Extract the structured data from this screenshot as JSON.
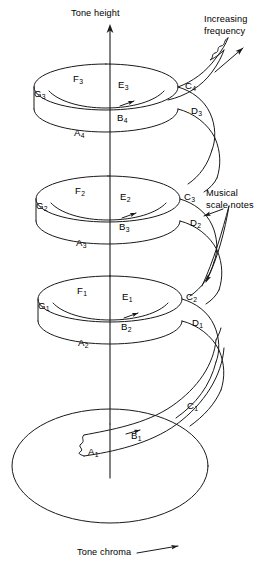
{
  "figure": {
    "stroke_color": "#1a1a1a",
    "text_color": "#000000",
    "background_color": "#ffffff",
    "width": 279,
    "height": 569
  },
  "axis_labels": {
    "tone_height": "Tone height",
    "tone_chroma": "Tone chroma",
    "increasing_frequency": "Increasing\nfrequency",
    "musical_scale_notes": "Musical\nscale notes"
  },
  "notes": [
    {
      "name": "G",
      "octave": "3",
      "x": 34,
      "y": 89
    },
    {
      "name": "F",
      "octave": "3",
      "x": 73,
      "y": 74
    },
    {
      "name": "E",
      "octave": "3",
      "x": 118,
      "y": 80
    },
    {
      "name": "C",
      "octave": "4",
      "x": 185,
      "y": 81
    },
    {
      "name": "D",
      "octave": "3",
      "x": 191,
      "y": 106
    },
    {
      "name": "B",
      "octave": "4",
      "x": 117,
      "y": 113
    },
    {
      "name": "A",
      "octave": "4",
      "x": 74,
      "y": 128
    },
    {
      "name": "G",
      "octave": "2",
      "x": 36,
      "y": 201
    },
    {
      "name": "F",
      "octave": "2",
      "x": 75,
      "y": 186
    },
    {
      "name": "E",
      "octave": "2",
      "x": 120,
      "y": 192
    },
    {
      "name": "C",
      "octave": "3",
      "x": 184,
      "y": 192
    },
    {
      "name": "D",
      "octave": "2",
      "x": 190,
      "y": 218
    },
    {
      "name": "B",
      "octave": "3",
      "x": 119,
      "y": 222
    },
    {
      "name": "A",
      "octave": "3",
      "x": 76,
      "y": 238
    },
    {
      "name": "G",
      "octave": "1",
      "x": 38,
      "y": 301
    },
    {
      "name": "F",
      "octave": "1",
      "x": 77,
      "y": 286
    },
    {
      "name": "E",
      "octave": "1",
      "x": 122,
      "y": 292
    },
    {
      "name": "C",
      "octave": "2",
      "x": 186,
      "y": 292
    },
    {
      "name": "D",
      "octave": "1",
      "x": 192,
      "y": 318
    },
    {
      "name": "B",
      "octave": "2",
      "x": 121,
      "y": 322
    },
    {
      "name": "A",
      "octave": "2",
      "x": 78,
      "y": 338
    },
    {
      "name": "C",
      "octave": "1",
      "x": 187,
      "y": 401
    },
    {
      "name": "B",
      "octave": "1",
      "x": 131,
      "y": 431
    },
    {
      "name": "A",
      "octave": "1",
      "x": 88,
      "y": 447
    }
  ],
  "annotations": {
    "tone_height_pos": {
      "x": 71,
      "y": 10
    },
    "tone_chroma_pos": {
      "x": 77,
      "y": 550
    },
    "increasing_freq_pos": {
      "x": 204,
      "y": 16
    },
    "musical_notes_pos": {
      "x": 208,
      "y": 190
    }
  }
}
